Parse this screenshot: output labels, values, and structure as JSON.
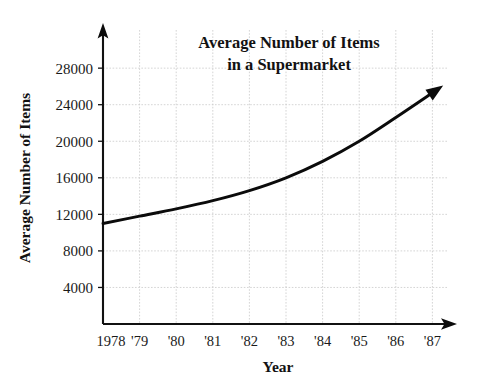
{
  "chart_data": {
    "type": "line",
    "title": "Average Number of Items in a Supermarket",
    "title_line1": "Average Number of Items",
    "title_line2": "in a Supermarket",
    "xlabel": "Year",
    "ylabel": "Average Number of Items",
    "categories": [
      "1978",
      "'79",
      "'80",
      "'81",
      "'82",
      "'83",
      "'84",
      "'85",
      "'86",
      "'87"
    ],
    "x": [
      1978,
      1979,
      1980,
      1981,
      1982,
      1983,
      1984,
      1985,
      1986,
      1987
    ],
    "values": [
      11000,
      11800,
      12600,
      13500,
      14600,
      16000,
      17800,
      20000,
      22600,
      25300
    ],
    "xlim": [
      1978,
      1987
    ],
    "ylim": [
      0,
      29000
    ],
    "ytick_labels": [
      "4000",
      "8000",
      "12000",
      "16000",
      "20000",
      "24000",
      "28000"
    ],
    "yticks": [
      4000,
      8000,
      12000,
      16000,
      20000,
      24000,
      28000
    ],
    "grid": true,
    "legend": null,
    "legend_position": "none",
    "series_name": "Average Number of Items",
    "line_color": "#0b0b0b",
    "grid_color": "#c9c9c9",
    "axis_color": "#111111",
    "background_color": "#ffffff",
    "axis_arrows": true,
    "annotations": []
  },
  "axis": {
    "y_arrow_name": "y-axis-arrow",
    "x_arrow_name": "x-axis-arrow"
  }
}
